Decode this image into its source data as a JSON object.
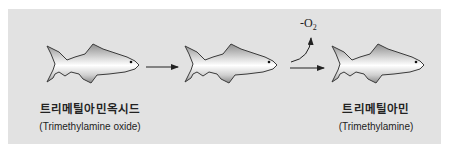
{
  "colors": {
    "background": "#ffffff",
    "panel": "#e2e2e2",
    "fish_outline": "#3a3a3a",
    "fish_dark": "#8a8a8a",
    "fish_light": "#ffffff",
    "arrow": "#222222"
  },
  "fish": [
    {
      "id": "fish-1",
      "x": 45,
      "y": 40
    },
    {
      "id": "fish-2",
      "x": 183,
      "y": 40
    },
    {
      "id": "fish-3",
      "x": 330,
      "y": 40
    }
  ],
  "labels": {
    "left": {
      "korean": "트리메틸아민옥시드",
      "english": "(Trimethylamine oxide)"
    },
    "right": {
      "korean": "트리메틸아민",
      "english": "(Trimethylamine)"
    }
  },
  "reaction": {
    "byproduct": "-O",
    "byproduct_subscript": "2"
  }
}
